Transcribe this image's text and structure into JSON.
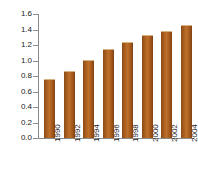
{
  "chart_data": {
    "type": "bar",
    "title": "",
    "xlabel": "",
    "ylabel": "Millions",
    "categories": [
      "1990",
      "1992",
      "1994",
      "1996",
      "1998",
      "2000",
      "2002",
      "2004"
    ],
    "values": [
      0.75,
      0.85,
      0.99,
      1.13,
      1.22,
      1.32,
      1.37,
      1.44
    ],
    "series": [
      {
        "name": "Millions",
        "values": [
          0.75,
          0.85,
          0.99,
          1.13,
          1.22,
          1.32,
          1.37,
          1.44
        ]
      }
    ],
    "ylim": [
      0.0,
      1.6
    ],
    "ytick_labels": [
      "1.6",
      "1.4",
      "1.2",
      "1.0",
      "0.8",
      "0.6",
      "0.4",
      "0.2",
      "0.0"
    ],
    "ytick_values": [
      1.6,
      1.4,
      1.2,
      1.0,
      0.8,
      0.6,
      0.4,
      0.2,
      0.0
    ],
    "grid": false,
    "legend": "none",
    "bar_color": "#a65c1e",
    "axis_color": "#8c8c8c",
    "text_color": "#1a1a1a",
    "background": "#ffffff"
  }
}
